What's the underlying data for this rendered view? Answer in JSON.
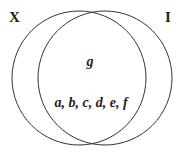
{
  "diagram": {
    "type": "venn",
    "sets": [
      {
        "id": "X",
        "label": "X"
      },
      {
        "id": "I",
        "label": "I"
      }
    ],
    "regions": [
      {
        "id": "upper-intersection",
        "label": "g"
      },
      {
        "id": "lower-intersection",
        "label": "a, b, c, d, e, f"
      }
    ],
    "colors": {
      "stroke": "#333333",
      "text": "#222222",
      "background": "#ffffff"
    }
  }
}
